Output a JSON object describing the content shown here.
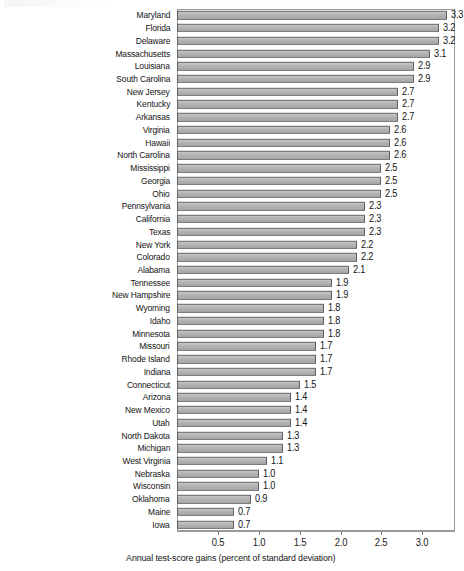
{
  "chart_data": {
    "type": "bar",
    "orientation": "horizontal",
    "title": "",
    "xlabel": "Annual test-score gains (percent of standard deviation)",
    "ylabel": "",
    "xlim": [
      0,
      3.4
    ],
    "xticks": [
      0.5,
      1.0,
      1.5,
      2.0,
      2.5,
      3.0
    ],
    "xtick_labels": [
      "0.5",
      "1.0",
      "1.5",
      "2.0",
      "2.5",
      "3.0"
    ],
    "grid": false,
    "legend": null,
    "bar_color": "#b3b3b3",
    "bar_edge_color": "#5f5f5f",
    "categories": [
      "Maryland",
      "Florida",
      "Delaware",
      "Massachusetts",
      "Louisiana",
      "South Carolina",
      "New Jersey",
      "Kentucky",
      "Arkansas",
      "Virginia",
      "Hawaii",
      "North Carolina",
      "Mississippi",
      "Georgia",
      "Ohio",
      "Pennsylvania",
      "California",
      "Texas",
      "New York",
      "Colorado",
      "Alabama",
      "Tennessee",
      "New Hampshire",
      "Wyoming",
      "Idaho",
      "Minnesota",
      "Missouri",
      "Rhode Island",
      "Indiana",
      "Connecticut",
      "Arizona",
      "New Mexico",
      "Utah",
      "North Dakota",
      "Michigan",
      "West Virginia",
      "Nebraska",
      "Wisconsin",
      "Oklahoma",
      "Maine",
      "Iowa"
    ],
    "values": [
      3.3,
      3.2,
      3.2,
      3.1,
      2.9,
      2.9,
      2.7,
      2.7,
      2.7,
      2.6,
      2.6,
      2.6,
      2.5,
      2.5,
      2.5,
      2.3,
      2.3,
      2.3,
      2.2,
      2.2,
      2.1,
      1.9,
      1.9,
      1.8,
      1.8,
      1.8,
      1.7,
      1.7,
      1.7,
      1.5,
      1.4,
      1.4,
      1.4,
      1.3,
      1.3,
      1.1,
      1.0,
      1.0,
      0.9,
      0.7,
      0.7
    ],
    "value_labels": [
      "3.3",
      "3.2",
      "3.2",
      "3.1",
      "2.9",
      "2.9",
      "2.7",
      "2.7",
      "2.7",
      "2.6",
      "2.6",
      "2.6",
      "2.5",
      "2.5",
      "2.5",
      "2.3",
      "2.3",
      "2.3",
      "2.2",
      "2.2",
      "2.1",
      "1.9",
      "1.9",
      "1.8",
      "1.8",
      "1.8",
      "1.7",
      "1.7",
      "1.7",
      "1.5",
      "1.4",
      "1.4",
      "1.4",
      "1.3",
      "1.3",
      "1.1",
      "1.0",
      "1.0",
      "0.9",
      "0.7",
      "0.7"
    ]
  }
}
